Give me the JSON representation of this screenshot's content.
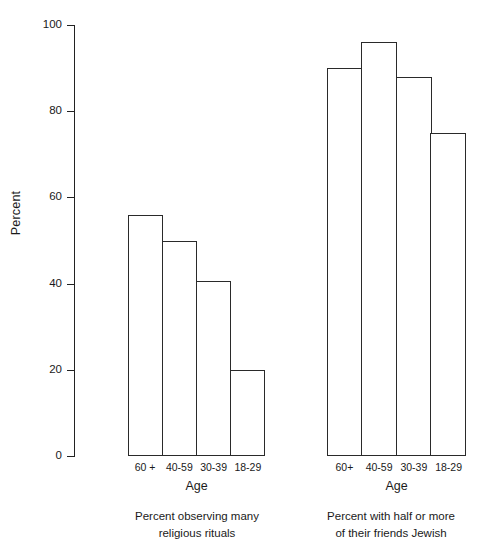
{
  "chart_data": {
    "type": "bar",
    "title": "",
    "xlabel": "Age",
    "ylabel": "Percent",
    "ylim": [
      0,
      100
    ],
    "yticks": [
      0,
      20,
      40,
      60,
      80,
      100
    ],
    "ytick_labels": [
      "0",
      "20",
      "40",
      "60",
      "80",
      "100"
    ],
    "grid": false,
    "legend": "none",
    "categories": [
      "60 +",
      "40-59",
      "30-39",
      "18-29"
    ],
    "panels": [
      {
        "name": "religious-rituals",
        "caption_lines": [
          "Percent observing many",
          "religious rituals"
        ],
        "xlabel": "Age",
        "categories": [
          "60 +",
          "40-59",
          "30-39",
          "18-29"
        ],
        "values": [
          56,
          50,
          40.5,
          20
        ]
      },
      {
        "name": "friends-jewish",
        "caption_lines": [
          "Percent with half or more",
          "of their friends Jewish"
        ],
        "xlabel": "Age",
        "categories": [
          "60+",
          "40-59",
          "30-39",
          "18-29"
        ],
        "values": [
          90,
          96,
          88,
          75
        ]
      }
    ],
    "series": [
      {
        "name": "Percent observing many religious rituals",
        "values": [
          56,
          50,
          40.5,
          20
        ]
      },
      {
        "name": "Percent with half or more of their friends Jewish",
        "values": [
          90,
          96,
          88,
          75
        ]
      }
    ],
    "colors": {
      "bar_fill": "#ffffff",
      "bar_stroke": "#2a2a2a",
      "axis": "#222222",
      "text": "#1a1a1a",
      "background": "#ffffff"
    }
  }
}
